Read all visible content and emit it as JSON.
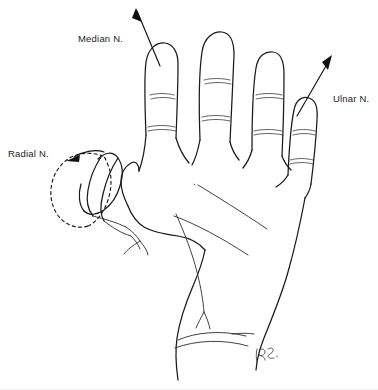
{
  "figure": {
    "kind": "anatomical-line-drawing",
    "background_color": "#ffffff",
    "ink_color": "#1a1a1a",
    "width": 378,
    "height": 390
  },
  "labels": {
    "median": "Median N.",
    "ulnar": "Ulnar N.",
    "radial": "Radial N."
  },
  "annotations": [
    {
      "id": "median-leader",
      "label": "Median N.",
      "style": "straight-arrow",
      "points_to": "index-finger-distal-phalanx",
      "arrow_direction": "up-left"
    },
    {
      "id": "ulnar-leader",
      "label": "Ulnar N.",
      "style": "straight-arrow",
      "points_to": "little-finger-distal-phalanx",
      "arrow_direction": "up-right"
    },
    {
      "id": "radial-leader",
      "label": "Radial N.",
      "style": "curved-arrow",
      "points_to": "thumb-dorsal-territory",
      "arrow_direction": "left"
    }
  ],
  "regions": {
    "radial_territory": {
      "name": "thumb dorsal sensory patch",
      "outline": "dashed"
    }
  },
  "signature": {
    "present": true,
    "text": "RB",
    "location": "lower-right wrist"
  }
}
